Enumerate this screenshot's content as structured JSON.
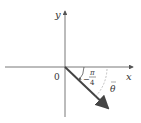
{
  "diagram": {
    "axes": {
      "x_label": "x",
      "y_label": "y",
      "origin_label": "0"
    },
    "angle_label": {
      "sign": "−",
      "numerator": "π",
      "denominator": "4"
    },
    "theta_label": "θ",
    "colors": {
      "axis": "#555555",
      "vector": "#444444",
      "arc": "#888888",
      "text": "#333333"
    }
  }
}
